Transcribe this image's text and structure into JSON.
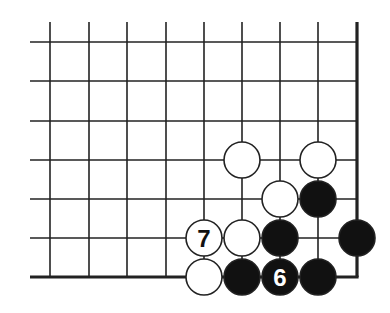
{
  "diagram": {
    "grid": {
      "x": [
        50,
        89,
        127,
        166,
        204,
        242,
        280,
        318,
        357
      ],
      "y": [
        42,
        81,
        121,
        160,
        199,
        238,
        277
      ],
      "edge_right_x": 357,
      "edge_bottom_y": 277,
      "top_extent_y": 22,
      "left_extent_x": 30
    },
    "stone_radius": 18,
    "colors": {
      "black": "#111111",
      "white": "#ffffff",
      "line": "#222222"
    },
    "stones": [
      {
        "color": "white",
        "col": 5,
        "row": 3,
        "label": ""
      },
      {
        "color": "white",
        "col": 7,
        "row": 3,
        "label": ""
      },
      {
        "color": "white",
        "col": 6,
        "row": 4,
        "label": ""
      },
      {
        "color": "black",
        "col": 7,
        "row": 4,
        "label": ""
      },
      {
        "color": "white",
        "col": 4,
        "row": 5,
        "label": "7"
      },
      {
        "color": "white",
        "col": 5,
        "row": 5,
        "label": ""
      },
      {
        "color": "black",
        "col": 6,
        "row": 5,
        "label": ""
      },
      {
        "color": "black",
        "col": 8,
        "row": 5,
        "label": ""
      },
      {
        "color": "white",
        "col": 4,
        "row": 6,
        "label": ""
      },
      {
        "color": "black",
        "col": 5,
        "row": 6,
        "label": ""
      },
      {
        "color": "black",
        "col": 6,
        "row": 6,
        "label": "6"
      },
      {
        "color": "black",
        "col": 7,
        "row": 6,
        "label": ""
      }
    ]
  }
}
